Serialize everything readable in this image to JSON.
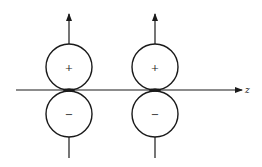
{
  "diagram": {
    "axis": {
      "label": "z",
      "y": 90,
      "x_start": 16,
      "x_end": 242
    },
    "colors": {
      "line": "#1a1a1a",
      "background": "#ffffff"
    },
    "dipoles": [
      {
        "x": 69,
        "upper": {
          "sign": "+",
          "cy": 67,
          "r": 23
        },
        "lower": {
          "sign": "−",
          "cy": 114,
          "r": 23
        }
      },
      {
        "x": 155,
        "upper": {
          "sign": "+",
          "cy": 67,
          "r": 23
        },
        "lower": {
          "sign": "−",
          "cy": 114,
          "r": 23
        }
      }
    ]
  }
}
